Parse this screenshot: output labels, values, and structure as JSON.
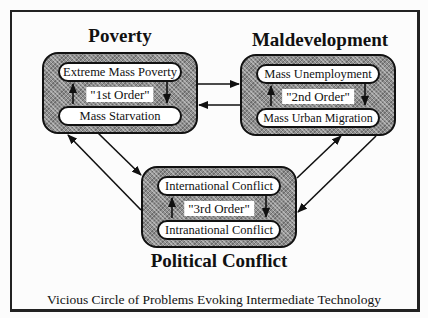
{
  "diagram": {
    "caption": "Vicious Circle of Problems Evoking Intermediate Technology",
    "groups": [
      {
        "id": "poverty",
        "title": "Poverty",
        "top_item": "Extreme Mass Poverty",
        "order_label": "\"1st Order\"",
        "bottom_item": "Mass Starvation"
      },
      {
        "id": "maldevelopment",
        "title": "Maldevelopment",
        "top_item": "Mass Unemployment",
        "order_label": "\"2nd Order\"",
        "bottom_item": "Mass Urban Migration"
      },
      {
        "id": "political-conflict",
        "title": "Political Conflict",
        "top_item": "International Conflict",
        "order_label": "\"3rd Order\"",
        "bottom_item": "Intranational Conflict"
      }
    ],
    "connections": [
      {
        "from": "poverty",
        "to": "maldevelopment"
      },
      {
        "from": "maldevelopment",
        "to": "poverty"
      },
      {
        "from": "poverty",
        "to": "political-conflict"
      },
      {
        "from": "political-conflict",
        "to": "poverty"
      },
      {
        "from": "political-conflict",
        "to": "maldevelopment"
      },
      {
        "from": "maldevelopment",
        "to": "political-conflict"
      }
    ],
    "internal_flow": "Top item flows down to bottom item; bottom item flows up to top item"
  }
}
